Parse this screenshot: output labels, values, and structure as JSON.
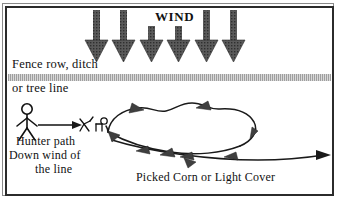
{
  "diagram": {
    "title_label": "WIND",
    "labels": {
      "fence_line_1": "Fence row, ditch",
      "fence_line_2": "or tree line",
      "hunter_path_1": "Hunter path",
      "hunter_path_2": "Down wind of",
      "hunter_path_3": "the line",
      "cover": "Picked Corn or Light Cover"
    },
    "colors": {
      "ink": "#111111",
      "frame_outer": "#8a8a8a",
      "frame_inner": "#2b2b2b",
      "fence_band": "#bdbdbd",
      "arrow_fill": "#4a4a4a",
      "field_dot": "#3a3a3a",
      "background": "#ffffff"
    },
    "wind_arrows": {
      "count": 6,
      "direction": "down",
      "x_positions": [
        97,
        124,
        152,
        179,
        207,
        234
      ],
      "top_y": 10,
      "tip_y": 62
    },
    "hunter": {
      "icon": "stick-figure-hunter",
      "x": 27,
      "y": 105,
      "path_arrow": {
        "from_x": 40,
        "to_x": 78,
        "y": 125
      }
    },
    "deer": {
      "icon": "deer-figures",
      "count": 2,
      "x_positions": [
        82,
        100
      ],
      "y": 124
    },
    "deer_loop": {
      "shape": "oval-circuit",
      "description": "Deer escape route loops right and exits right",
      "arrowhead_count": 8,
      "exit_arrow_x": 330
    }
  }
}
